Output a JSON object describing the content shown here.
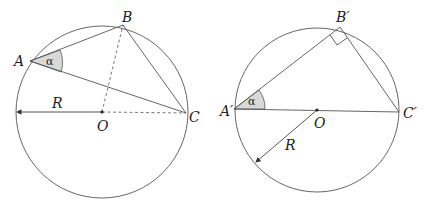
{
  "colors": {
    "stroke": "#555555",
    "angle_fill": "#d9d9d9",
    "text": "#222222",
    "background": "#ffffff"
  },
  "left_figure": {
    "circle": {
      "cx": 102,
      "cy": 112,
      "r": 86
    },
    "points": {
      "A": {
        "label": "A",
        "x": 30,
        "y": 61
      },
      "B": {
        "label": "B",
        "x": 123,
        "y": 25
      },
      "C": {
        "label": "C",
        "x": 186,
        "y": 113
      },
      "O": {
        "label": "O",
        "x": 102,
        "y": 112
      }
    },
    "angle_label": "α",
    "radius_label": "R",
    "radius_end": {
      "x": 16,
      "y": 112
    }
  },
  "right_figure": {
    "circle": {
      "cx": 317,
      "cy": 110,
      "r": 82
    },
    "points": {
      "A": {
        "label": "A′",
        "x": 235,
        "y": 109
      },
      "B": {
        "label": "B′",
        "x": 340,
        "y": 27
      },
      "C": {
        "label": "C′",
        "x": 399,
        "y": 112
      },
      "O": {
        "label": "O",
        "x": 317,
        "y": 110
      }
    },
    "angle_label": "α",
    "radius_label": "R",
    "radius_end": {
      "x": 255,
      "y": 163
    },
    "right_angle_marker": true
  }
}
